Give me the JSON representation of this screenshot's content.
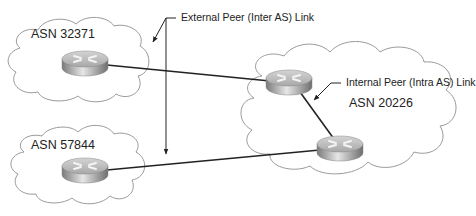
{
  "diagram": {
    "type": "bgp-peering-topology",
    "colors": {
      "cloud_stroke": "#9a9a9a",
      "link": "#222222",
      "router_body": "#9e9e9e",
      "router_top": "#c8c8c8"
    },
    "autonomous_systems": [
      {
        "id": "as1",
        "label": "ASN 32371"
      },
      {
        "id": "as2",
        "label": "ASN 57844"
      },
      {
        "id": "as3",
        "label": "ASN 20226"
      }
    ],
    "routers": [
      {
        "id": "r1",
        "as": "ASN 32371",
        "icon": "router-icon"
      },
      {
        "id": "r2",
        "as": "ASN 57844",
        "icon": "router-icon"
      },
      {
        "id": "r3",
        "as": "ASN 20226",
        "icon": "router-icon"
      },
      {
        "id": "r4",
        "as": "ASN 20226",
        "icon": "router-icon"
      }
    ],
    "links": [
      {
        "from": "r1",
        "to": "r3",
        "kind": "External Peer (Inter AS) Link"
      },
      {
        "from": "r2",
        "to": "r4",
        "kind": "External Peer (Inter AS) Link"
      },
      {
        "from": "r3",
        "to": "r4",
        "kind": "Internal Peer (Intra AS) Link"
      }
    ],
    "callouts": {
      "external": "External Peer (Inter AS) Link",
      "internal": "Internal Peer (Intra AS) Link"
    }
  }
}
